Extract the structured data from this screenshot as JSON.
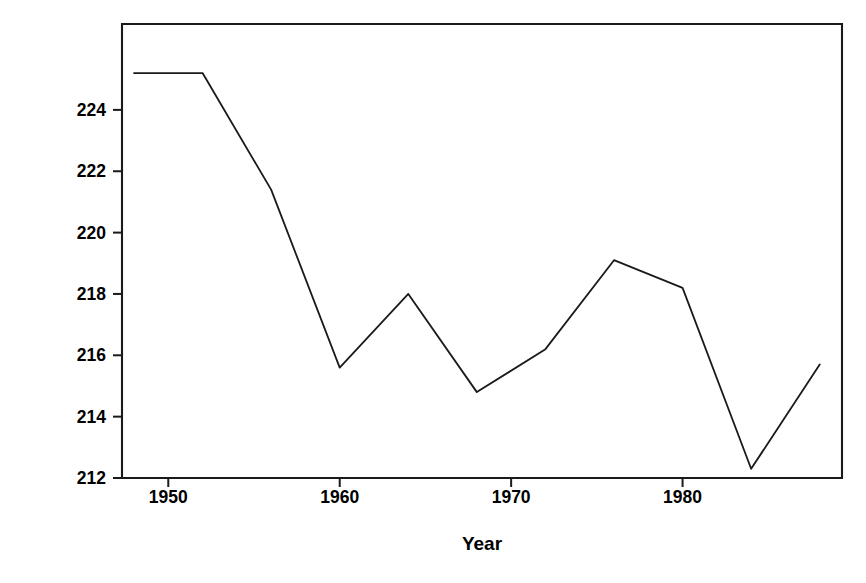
{
  "chart_data": {
    "type": "line",
    "title": "",
    "xlabel": "Year",
    "ylabel": "Time for 1500 m (s)",
    "xlim": [
      1947.3,
      1989.3
    ],
    "ylim": [
      212.0,
      226.8
    ],
    "grid": false,
    "legend": null,
    "xticks": [
      1950,
      1960,
      1970,
      1980
    ],
    "xticklabels": [
      "1950",
      "1960",
      "1970",
      "1980"
    ],
    "yticks": [
      212,
      214,
      216,
      218,
      220,
      222,
      224
    ],
    "yticklabels": [
      "212",
      "214",
      "216",
      "218",
      "220",
      "222",
      "224"
    ],
    "series": [
      {
        "name": "Winning time",
        "x": [
          1948,
          1952,
          1956,
          1960,
          1964,
          1968,
          1972,
          1976,
          1980,
          1984,
          1988
        ],
        "values": [
          225.2,
          225.2,
          221.4,
          215.6,
          218.0,
          214.8,
          216.2,
          219.1,
          218.2,
          212.3,
          215.7
        ]
      }
    ],
    "line_color": "#1a1a1a",
    "line_width": 1.8,
    "axis_color": "#1a1a1a",
    "background": "#ffffff"
  },
  "axes": {
    "y_title": "Time for 1500 m (s)",
    "x_title": "Year"
  }
}
